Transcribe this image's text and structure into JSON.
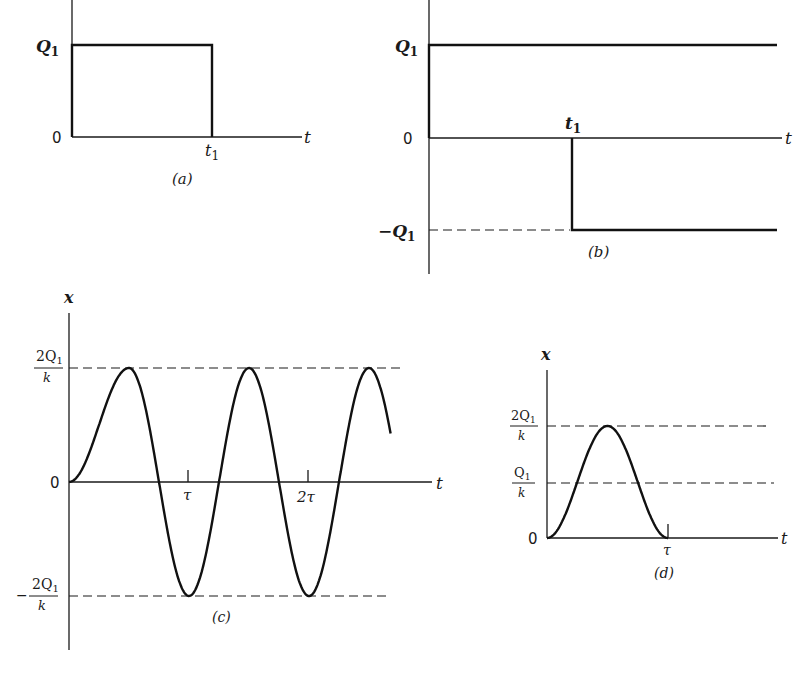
{
  "figure": {
    "panels": [
      {
        "id": "a",
        "caption": "(a)",
        "type": "rectangular pulse",
        "y_labels": {
          "top": "Q",
          "top_sub": "1",
          "zero": "0"
        },
        "x_labels": {
          "axis": "t",
          "tick": "t",
          "tick_sub": "1"
        }
      },
      {
        "id": "b",
        "caption": "(b)",
        "type": "step decomposition",
        "y_labels": {
          "top": "Q",
          "top_sub": "1",
          "zero": "0",
          "bottom": "−Q",
          "bottom_sub": "1"
        },
        "x_labels": {
          "axis": "t",
          "tick": "t",
          "tick_sub": "1"
        }
      },
      {
        "id": "c",
        "caption": "(c)",
        "type": "oscillatory response",
        "y_axis_label": "x",
        "y_labels": {
          "top_num": "2Q",
          "top_num_sub": "1",
          "top_den": "k",
          "zero": "0",
          "bottom_sign": "−",
          "bottom_num": "2Q",
          "bottom_num_sub": "1",
          "bottom_den": "k"
        },
        "x_labels": {
          "axis": "t",
          "tick1": "τ",
          "tick2": "2τ"
        }
      },
      {
        "id": "d",
        "caption": "(d)",
        "type": "single-cycle response",
        "y_axis_label": "x",
        "y_labels": {
          "top_num": "2Q",
          "top_num_sub": "1",
          "top_den": "k",
          "mid_num": "Q",
          "mid_num_sub": "1",
          "mid_den": "k",
          "zero": "0"
        },
        "x_labels": {
          "axis": "t",
          "tick": "τ"
        }
      }
    ]
  },
  "chart_data": [
    {
      "type": "line",
      "title": "(a)",
      "xlabel": "t",
      "ylabel": "",
      "series": [
        {
          "name": "pulse",
          "x": [
            0,
            0,
            "t1",
            "t1"
          ],
          "y": [
            0,
            "Q1",
            "Q1",
            0
          ]
        }
      ],
      "yticks": [
        "0",
        "Q1"
      ],
      "xticks": [
        "t1"
      ]
    },
    {
      "type": "line",
      "title": "(b)",
      "xlabel": "t",
      "ylabel": "",
      "series": [
        {
          "name": "positive step",
          "x": [
            0,
            "inf"
          ],
          "y": [
            "Q1",
            "Q1"
          ]
        },
        {
          "name": "negative step",
          "x": [
            "t1",
            "t1",
            "inf"
          ],
          "y": [
            0,
            "-Q1",
            "-Q1"
          ]
        }
      ],
      "yticks": [
        "-Q1",
        "0",
        "Q1"
      ],
      "xticks": [
        "t1"
      ]
    },
    {
      "type": "line",
      "title": "(c)",
      "xlabel": "t",
      "ylabel": "x",
      "x_units": "tau",
      "series": [
        {
          "name": "x(t)",
          "x": [
            0,
            0.5,
            1.0,
            1.5,
            2.0,
            2.5,
            2.68
          ],
          "y": [
            0,
            1,
            -1,
            1,
            -1,
            1,
            0.6
          ],
          "y_units": "2Q1/k"
        }
      ],
      "yticks": [
        "-2Q1/k",
        "0",
        "2Q1/k"
      ],
      "xticks": [
        "τ",
        "2τ"
      ],
      "reference_lines": [
        "2Q1/k",
        "-2Q1/k"
      ]
    },
    {
      "type": "line",
      "title": "(d)",
      "xlabel": "t",
      "ylabel": "x",
      "x_units": "tau",
      "series": [
        {
          "name": "x(t)",
          "x": [
            0,
            0.25,
            0.5,
            0.75,
            1.0
          ],
          "y": [
            0,
            0.5,
            1,
            0.5,
            0
          ],
          "y_units": "2Q1/k"
        }
      ],
      "yticks": [
        "0",
        "Q1/k",
        "2Q1/k"
      ],
      "xticks": [
        "τ"
      ],
      "reference_lines": [
        "Q1/k",
        "2Q1/k"
      ]
    }
  ]
}
